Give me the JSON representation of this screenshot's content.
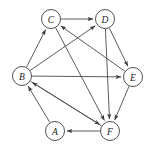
{
  "figure": {
    "type": "directed-graph",
    "background_color": "#ffffff",
    "node_fill": "#ffffff",
    "node_stroke": "#3c3c3c",
    "edge_color": "#4a4a4a",
    "label_color": "#1a1a1a",
    "node_radius": 9.5,
    "width": 152,
    "height": 151
  },
  "nodes": [
    {
      "id": "A",
      "label": "A",
      "x": 55,
      "y": 131
    },
    {
      "id": "B",
      "label": "B",
      "x": 22,
      "y": 76
    },
    {
      "id": "C",
      "label": "C",
      "x": 51,
      "y": 19
    },
    {
      "id": "D",
      "label": "D",
      "x": 105,
      "y": 19
    },
    {
      "id": "E",
      "label": "E",
      "x": 133,
      "y": 77
    },
    {
      "id": "F",
      "label": "F",
      "x": 110,
      "y": 131
    }
  ],
  "edges": [
    {
      "id": "C-D",
      "from": "C",
      "to": "D",
      "directed": true
    },
    {
      "id": "B-C",
      "from": "B",
      "to": "C",
      "directed": true
    },
    {
      "id": "B-D",
      "from": "B",
      "to": "D",
      "directed": true
    },
    {
      "id": "B-E",
      "from": "B",
      "to": "E",
      "directed": true
    },
    {
      "id": "B-F",
      "from": "B",
      "to": "F",
      "directed": true
    },
    {
      "id": "C-F",
      "from": "C",
      "to": "F",
      "directed": true
    },
    {
      "id": "D-E",
      "from": "D",
      "to": "E",
      "directed": true
    },
    {
      "id": "D-F",
      "from": "D",
      "to": "F",
      "directed": true
    },
    {
      "id": "E-C",
      "from": "E",
      "to": "C",
      "directed": true
    },
    {
      "id": "E-F",
      "from": "E",
      "to": "F",
      "directed": true
    },
    {
      "id": "F-A",
      "from": "F",
      "to": "A",
      "directed": true
    },
    {
      "id": "F-B",
      "from": "F",
      "to": "B",
      "directed": true
    },
    {
      "id": "A-B",
      "from": "A",
      "to": "B",
      "directed": true
    }
  ]
}
